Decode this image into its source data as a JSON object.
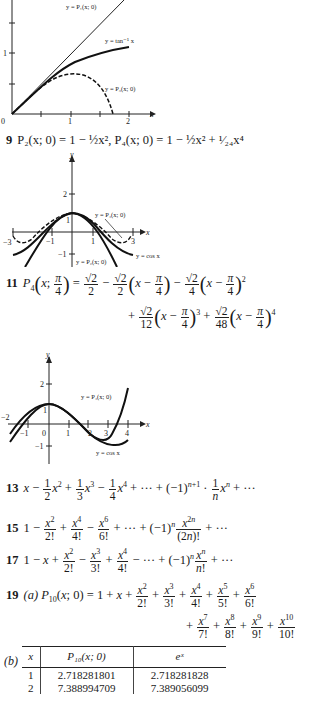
{
  "graphs": {
    "g7": {
      "labels": {
        "p1": "y = P₁(x; 0)",
        "atan": "y = tan⁻¹ x",
        "p3": "y = P₃(x; 0)"
      },
      "ticks": {
        "y1": "1",
        "x0": "0",
        "x1": "1",
        "x2": "2",
        "xaxis": "x"
      }
    },
    "g9": {
      "labels": {
        "p4": "y = P₄(x; 0)",
        "cos": "y = cos x",
        "p2": "y = P₂(x; 0)"
      },
      "ticks": {
        "y2": "2",
        "y1": "1",
        "ym1": "−1",
        "ym2": "−2",
        "xm3": "−3",
        "xm1": "−1",
        "x1": "1",
        "x3": "3",
        "xaxis": "x",
        "yaxis": "y"
      }
    },
    "g11": {
      "labels": {
        "p4": "y = P₄(x; 0)",
        "cos": "y = cos x"
      },
      "ticks": {
        "y2": "2",
        "y1": "1",
        "ym1": "−1",
        "ym2": "−2",
        "xm2": "−2",
        "xm1": "−1",
        "x0": "0",
        "x1": "1",
        "x2": "2",
        "x3": "3",
        "x4": "4",
        "xaxis": "x",
        "yaxis": "y"
      }
    }
  },
  "problems": {
    "p9": {
      "num": "9",
      "text": "P₂(x; 0) = 1 − ½x², P₄(x; 0) = 1 − ½x² + ¹⁄₂₄x⁴"
    },
    "p11": {
      "num": "11"
    },
    "p13": {
      "num": "13"
    },
    "p15": {
      "num": "15"
    },
    "p17": {
      "num": "17"
    },
    "p19": {
      "num": "19",
      "part_a": "(a)",
      "part_b": "(b)"
    }
  },
  "table": {
    "headers": [
      "x",
      "P₁₀(x; 0)",
      "eˣ"
    ],
    "rows": [
      [
        "1",
        "2.718281801",
        "2.718281828"
      ],
      [
        "2",
        "7.388994709",
        "7.389056099"
      ]
    ]
  }
}
